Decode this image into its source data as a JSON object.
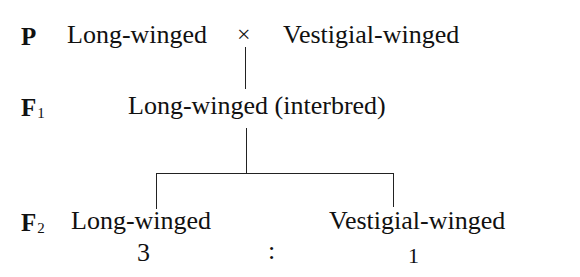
{
  "generations": {
    "p": {
      "label": "P",
      "subscript": ""
    },
    "f1": {
      "label": "F",
      "subscript": "1"
    },
    "f2": {
      "label": "F",
      "subscript": "2"
    }
  },
  "parents": {
    "left": "Long-winged",
    "cross_symbol": "×",
    "right": "Vestigial-winged"
  },
  "f1": {
    "phenotype": "Long-winged (interbred)"
  },
  "f2": {
    "left": "Long-winged",
    "right": "Vestigial-winged",
    "ratio_left": "3",
    "ratio_separator": ":",
    "ratio_right": "1"
  }
}
